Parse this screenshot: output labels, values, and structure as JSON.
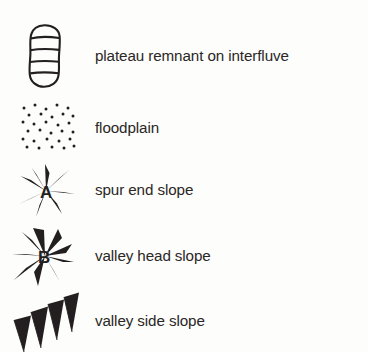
{
  "legend": {
    "title": "Geomorphological map legend",
    "background_color": "#fdfdfc",
    "ink_color": "#231f20",
    "rows": [
      {
        "symbol_name": "plateau-remnant-symbol",
        "symbol_type": "rounded-capsule-with-horizontal-hatch-lines",
        "symbol_letter": "",
        "label": "plateau remnant on interfluve"
      },
      {
        "symbol_name": "floodplain-symbol",
        "symbol_type": "stipple-dot-pattern",
        "symbol_letter": "",
        "label": "floodplain"
      },
      {
        "symbol_name": "spur-end-slope-symbol",
        "symbol_type": "radiating-outward-hachure-spikes",
        "symbol_letter": "A",
        "label": "spur end slope"
      },
      {
        "symbol_name": "valley-head-slope-symbol",
        "symbol_type": "ring-of-inward-pointing-hachure-spikes",
        "symbol_letter": "B",
        "label": "valley head slope"
      },
      {
        "symbol_name": "valley-side-slope-symbol",
        "symbol_type": "row-of-hachure-spikes-on-diagonal-baseline",
        "symbol_letter": "",
        "label": "valley side slope"
      }
    ]
  }
}
